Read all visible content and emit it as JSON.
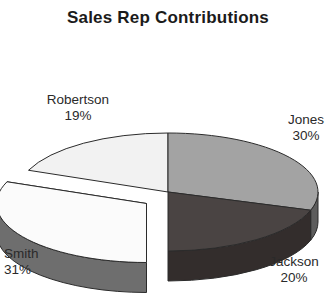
{
  "chart_data": {
    "type": "pie",
    "title": "Sales Rep Contributions",
    "subtitle": "",
    "xlabel": "",
    "ylabel": "",
    "legend_position": "none",
    "labels_position": "outside",
    "three_d": true,
    "exploded_slice": "Smith",
    "start_angle_deg": 0,
    "direction": "clockwise",
    "categories": [
      "Jones",
      "Jackson",
      "Smith",
      "Robertson"
    ],
    "values": [
      30,
      20,
      31,
      19
    ],
    "value_unit": "%",
    "slices": [
      {
        "name": "Jones",
        "value": 30,
        "label": "Jones",
        "percent_label": "30%",
        "top_color": "#a3a3a3",
        "side_color": "#5d5d5d",
        "exploded": false
      },
      {
        "name": "Jackson",
        "value": 20,
        "label": "Jackson",
        "percent_label": "20%",
        "top_color": "#4a4443",
        "side_color": "#332d2c",
        "exploded": false
      },
      {
        "name": "Smith",
        "value": 31,
        "label": "Smith",
        "percent_label": "31%",
        "top_color": "#fbfbfb",
        "side_color": "#6e6e6e",
        "exploded": true
      },
      {
        "name": "Robertson",
        "value": 19,
        "label": "Robertson",
        "percent_label": "19%",
        "top_color": "#f2f2f2",
        "side_color": "#6b6b6b",
        "exploded": false
      }
    ],
    "background_color": "#ffffff",
    "outline_color": "#2b2b2b"
  }
}
